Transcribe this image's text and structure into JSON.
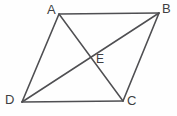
{
  "figure": {
    "kind": "geometry-diagram",
    "shape": "parallelogram",
    "background_color": "#fefefe",
    "line_color": "#4f4f52",
    "label_color": "#3f3f42",
    "width": 177,
    "height": 116,
    "vertices": [
      {
        "id": "A",
        "label": "A",
        "x": 59,
        "y": 14
      },
      {
        "id": "B",
        "label": "B",
        "x": 159,
        "y": 13
      },
      {
        "id": "C",
        "label": "C",
        "x": 123,
        "y": 101
      },
      {
        "id": "D",
        "label": "D",
        "x": 22,
        "y": 102
      }
    ],
    "interior_points": [
      {
        "id": "E",
        "label": "E",
        "x": 92,
        "y": 59
      }
    ],
    "edges": [
      {
        "id": "AB",
        "from": "A",
        "to": "B"
      },
      {
        "id": "BC",
        "from": "B",
        "to": "C"
      },
      {
        "id": "CD",
        "from": "C",
        "to": "D"
      },
      {
        "id": "DA",
        "from": "D",
        "to": "A"
      }
    ],
    "diagonals": [
      {
        "id": "AC",
        "from": "A",
        "to": "C"
      },
      {
        "id": "BD",
        "from": "B",
        "to": "D"
      }
    ],
    "labels": {
      "A": "A",
      "B": "B",
      "C": "C",
      "D": "D",
      "E": "E"
    }
  }
}
